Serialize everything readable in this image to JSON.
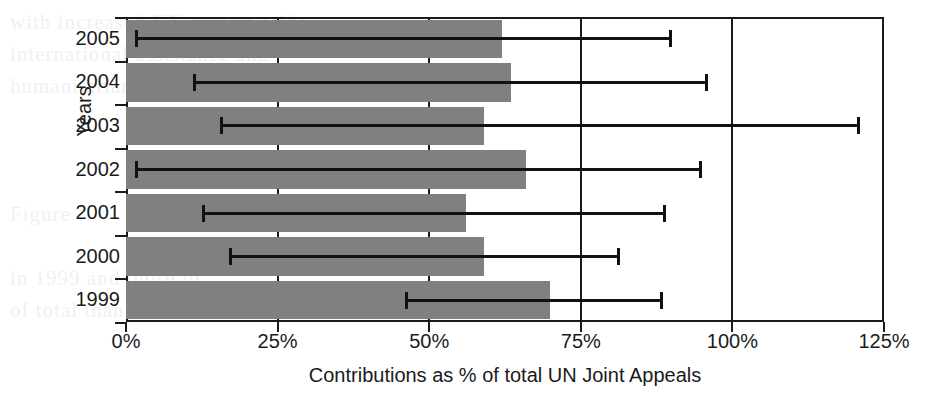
{
  "chart_data": {
    "type": "bar",
    "orientation": "horizontal",
    "title": "",
    "xlabel": "Contributions as % of total UN Joint Appeals",
    "ylabel": "Years",
    "categories": [
      "2005",
      "2004",
      "2003",
      "2002",
      "2001",
      "2000",
      "1999"
    ],
    "values": [
      62,
      63.5,
      59,
      66,
      56,
      59,
      70
    ],
    "error_low": [
      1.5,
      11,
      15.5,
      1.5,
      12.5,
      17,
      46
    ],
    "error_high": [
      90,
      96,
      121,
      95,
      89,
      81.5,
      88.5
    ],
    "error_style": "asymmetric-range-line",
    "xlim": [
      0,
      125
    ],
    "ylim_categorical": true,
    "xticks": [
      0,
      25,
      50,
      75,
      100,
      125
    ],
    "xtick_labels": [
      "0%",
      "25%",
      "50%",
      "75%",
      "100%",
      "125%"
    ],
    "grid": "vertical-only",
    "legend": "none",
    "bar_color": "#808080",
    "error_color": "#111111",
    "axis_color": "#1b1b1b",
    "background": "#ffffff"
  },
  "ghost_text": {
    "lines": [
      "with increased UN system-wide",
      "international assistance and",
      "humanitarian coordination",
      "",
      "",
      "",
      "Figure",
      "",
      "in 1999 and those to",
      "of total than those allocated"
    ]
  }
}
